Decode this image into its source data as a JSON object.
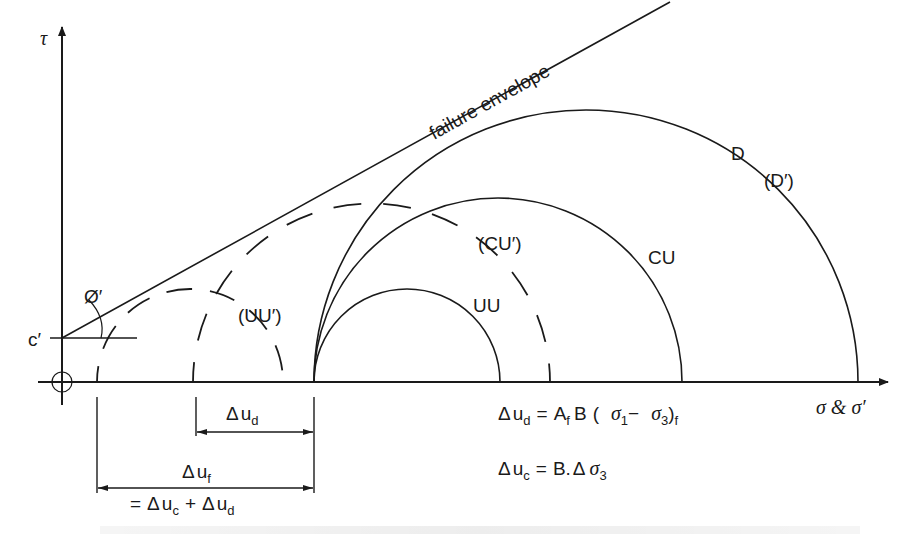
{
  "diagram": {
    "axes": {
      "y_label": "τ",
      "x_label": "σ & σ′",
      "origin_symbol": "origin-crosshair"
    },
    "envelope": {
      "label": "failure envelope",
      "intercept_label": "c′",
      "angle_label": "Ø′"
    },
    "circles": {
      "total": [
        {
          "id": "UU",
          "label": "UU",
          "style": "solid"
        },
        {
          "id": "CU",
          "label": "CU",
          "style": "solid"
        },
        {
          "id": "D",
          "label": "D",
          "style": "solid"
        }
      ],
      "effective": [
        {
          "id": "UU'",
          "label": "(UU′)",
          "style": "dashed"
        },
        {
          "id": "CU'",
          "label": "(CU′)",
          "style": "dashed"
        },
        {
          "id": "D'",
          "label": "(D′)",
          "style": "coincident"
        }
      ]
    },
    "dimensions": {
      "du_d": {
        "delta": "Δ",
        "u": "u",
        "sub": "d"
      },
      "du_f": {
        "delta": "Δ",
        "u": "u",
        "sub": "f"
      },
      "du_f_eq": {
        "eq": "=",
        "delta1": "Δ",
        "u1": "u",
        "sub1": "c",
        "plus": "+",
        "delta2": "Δ",
        "u2": "u",
        "sub2": "d"
      }
    },
    "equations": {
      "eq1": {
        "lhs_delta": "Δ",
        "lhs_u": "u",
        "lhs_sub": "d",
        "eq": "=",
        "A": "A",
        "A_sub": "f",
        "B": "B",
        "open": "(",
        "s1": "σ",
        "s1_sub": "1",
        "minus": "−",
        "s3": "σ",
        "s3_sub": "3",
        "close": ")",
        "close_sub": "f"
      },
      "eq2": {
        "lhs_delta": "Δ",
        "lhs_u": "u",
        "lhs_sub": "c",
        "eq": "=",
        "B": "B.",
        "delta": "Δ",
        "s3": "σ",
        "s3_sub": "3"
      }
    }
  }
}
